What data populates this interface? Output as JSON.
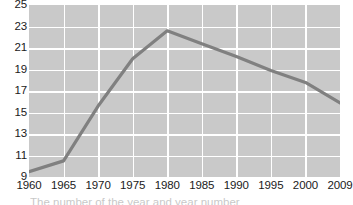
{
  "chart_data": {
    "type": "line",
    "title": "",
    "subtitle": "",
    "xlabel": "",
    "ylabel": "",
    "x": [
      1960,
      1965,
      1970,
      1975,
      1980,
      1985,
      1990,
      1995,
      2000,
      2009
    ],
    "xticklabels": [
      "1960",
      "1965",
      "1970",
      "1975",
      "1980",
      "1985",
      "1990",
      "1995",
      "2000",
      "2009"
    ],
    "yticklabels": [
      "25",
      "23",
      "21",
      "19",
      "17",
      "15",
      "13",
      "11",
      "9"
    ],
    "yticks": [
      25,
      23,
      21,
      19,
      17,
      15,
      13,
      11,
      9
    ],
    "ylim": [
      9,
      25
    ],
    "xlim": [
      1960,
      2009
    ],
    "grid": true,
    "legend": false,
    "legend_position": "none",
    "series": [
      {
        "name": "value",
        "color": "#808080",
        "values": [
          9.5,
          10.5,
          15.6,
          20.0,
          22.6,
          21.4,
          20.2,
          18.9,
          17.8,
          15.9
        ]
      }
    ],
    "plot_background": "#c9c9c9",
    "gridline_color": "#ffffff",
    "line_color": "#808080",
    "line_width": 3.2,
    "annotations": []
  },
  "caption": {
    "clipped_line": "The number of the  year   and    year    number"
  }
}
